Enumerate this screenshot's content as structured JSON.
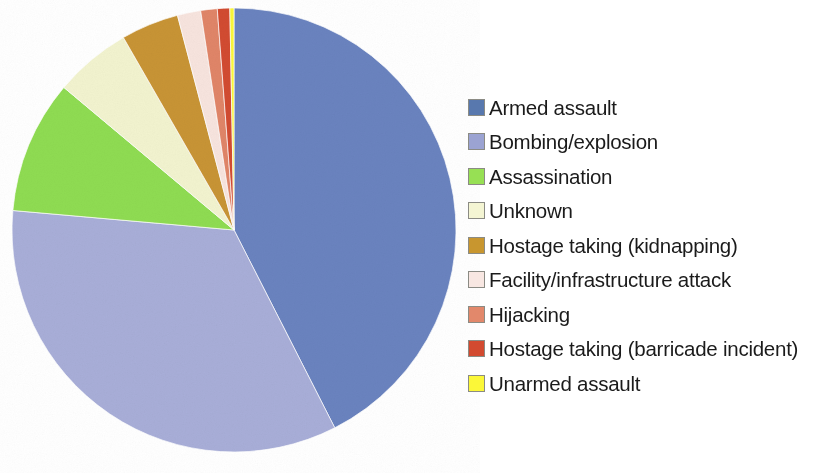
{
  "chart_data": {
    "type": "pie",
    "title": "",
    "subtitle": "",
    "xlabel": "",
    "ylabel": "",
    "legend_position": "right",
    "start_angle_deg": 0,
    "direction": "clockwise",
    "categories": [
      "Armed assault",
      "Bombing/explosion",
      "Assassination",
      "Unknown",
      "Hostage taking (kidnapping)",
      "Facility/infrastructure attack",
      "Hijacking",
      "Hostage taking (barricade incident)",
      "Unarmed assault"
    ],
    "values": [
      42.5,
      33.9,
      9.7,
      5.6,
      4.2,
      1.7,
      1.2,
      0.9,
      0.3
    ],
    "unit": "percent",
    "colors": [
      "#6a83bf",
      "#a8aed8",
      "#8fdc52",
      "#f2f3cf",
      "#c89435",
      "#f7e4de",
      "#e08568",
      "#d24b31",
      "#fbf738"
    ],
    "slices": [
      {
        "label": "Armed assault",
        "value": 42.5,
        "color": "#6a83bf",
        "swatch": "#5878ae"
      },
      {
        "label": "Bombing/explosion",
        "value": 33.9,
        "color": "#a8aed8",
        "swatch": "#9ba3d2"
      },
      {
        "label": "Assassination",
        "value": 9.7,
        "color": "#8fdc52",
        "swatch": "#97e054"
      },
      {
        "label": "Unknown",
        "value": 5.6,
        "color": "#f2f3cf",
        "swatch": "#f4f5d3"
      },
      {
        "label": "Hostage taking (kidnapping)",
        "value": 4.2,
        "color": "#c89435",
        "swatch": "#c8962f"
      },
      {
        "label": "Facility/infrastructure attack",
        "value": 1.7,
        "color": "#f7e4de",
        "swatch": "#f8e7e2"
      },
      {
        "label": "Hijacking",
        "value": 1.2,
        "color": "#e08568",
        "swatch": "#e2886b"
      },
      {
        "label": "Hostage taking (barricade incident)",
        "value": 0.9,
        "color": "#d24b31",
        "swatch": "#d24a30"
      },
      {
        "label": "Unarmed assault",
        "value": 0.3,
        "color": "#fbf738",
        "swatch": "#fbf738"
      }
    ]
  },
  "legend": {
    "items": [
      {
        "label": "Armed assault"
      },
      {
        "label": "Bombing/explosion"
      },
      {
        "label": "Assassination"
      },
      {
        "label": "Unknown"
      },
      {
        "label": "Hostage taking (kidnapping)"
      },
      {
        "label": "Facility/infrastructure attack"
      },
      {
        "label": "Hijacking"
      },
      {
        "label": "Hostage taking (barricade incident)"
      },
      {
        "label": "Unarmed assault"
      }
    ]
  }
}
